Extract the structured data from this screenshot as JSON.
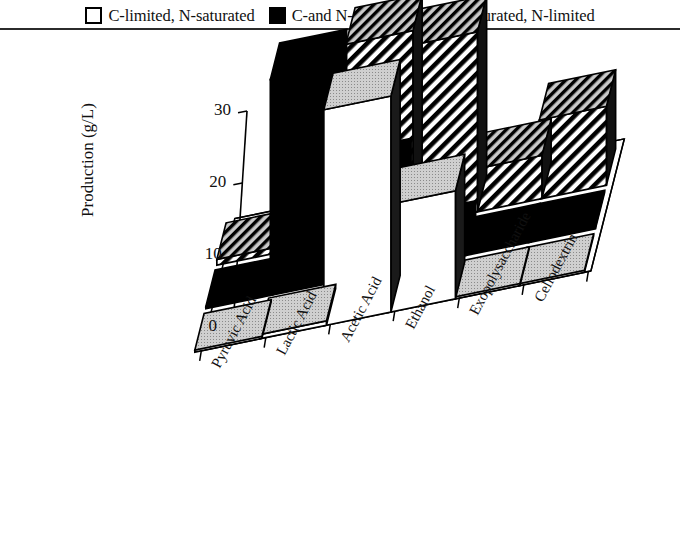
{
  "legend": {
    "items": [
      {
        "label": "C-limited, N-saturated",
        "swatch": "open-square-icon",
        "style": "open"
      },
      {
        "label": "C-and N-saturated",
        "swatch": "filled-square-icon",
        "style": "solid"
      },
      {
        "label": "C-saturated, N-limited",
        "swatch": "hatched-square-icon",
        "style": "hatch"
      }
    ]
  },
  "chart_data": {
    "type": "bar",
    "title": "",
    "xlabel": "",
    "ylabel": "Production (g/L)",
    "ylim": [
      0,
      30
    ],
    "yticks": [
      0,
      10,
      20,
      30
    ],
    "ytick_labels": [
      "0",
      "10",
      "20",
      "30"
    ],
    "grid": false,
    "legend_position": "top",
    "projection": "3d",
    "categories": [
      "Pyruvic Acid",
      "Lactic Acid",
      "Acetic Acid",
      "Ethanol",
      "Exopolysaccharide",
      "Cellodextrin"
    ],
    "series": [
      {
        "name": "C-limited, N-saturated",
        "style": "open",
        "values": [
          0.3,
          0.6,
          30.0,
          15.0,
          0.3,
          0.3
        ]
      },
      {
        "name": "C-and N-saturated",
        "style": "solid",
        "values": [
          0.2,
          30.0,
          13.0,
          2.5,
          0.2,
          0.2
        ]
      },
      {
        "name": "C-saturated, N-limited",
        "style": "hatch",
        "values": [
          0.8,
          17.0,
          27.0,
          25.0,
          6.0,
          11.0
        ]
      }
    ]
  },
  "colors": {
    "ink": "#000000",
    "paper": "#ffffff",
    "top_face": "#c9c9c9",
    "side_face": "#1a1a1a",
    "rule": "#2b2b2b"
  }
}
